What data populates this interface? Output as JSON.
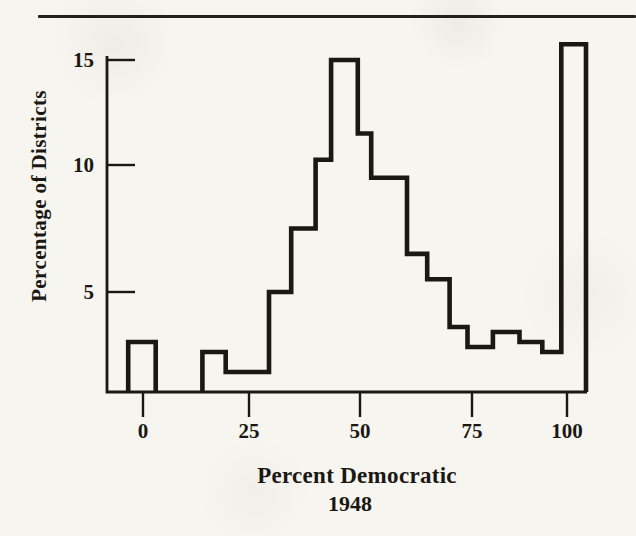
{
  "page": {
    "background_hex": "#f6f5f0",
    "ink_hex": "#1b1813",
    "top_rule_present": true
  },
  "chart_data": {
    "type": "bar",
    "subtype": "step-outline histogram (scanned book figure)",
    "title": "",
    "xlabel": "Percent Democratic",
    "xlabel_line2": "1948",
    "ylabel": "Percentage of Districts",
    "x_ticks": [
      0,
      25,
      50,
      75,
      100
    ],
    "y_ticks": [
      5,
      10,
      15
    ],
    "xlim": [
      -8.5,
      105
    ],
    "ylim": [
      0,
      16.5
    ],
    "grid": false,
    "legend": false,
    "bins": [
      {
        "x0": -3.5,
        "x1": 3,
        "height": 2.5
      },
      {
        "x0": 14,
        "x1": 19.5,
        "height": 2
      },
      {
        "x0": 19.5,
        "x1": 29.5,
        "height": 1
      },
      {
        "x0": 29.5,
        "x1": 34.5,
        "height": 5
      },
      {
        "x0": 34.5,
        "x1": 40,
        "height": 7.5
      },
      {
        "x0": 40,
        "x1": 43.5,
        "height": 10.25
      },
      {
        "x0": 43.5,
        "x1": 49.5,
        "height": 15
      },
      {
        "x0": 49.5,
        "x1": 52.5,
        "height": 11.5
      },
      {
        "x0": 52.5,
        "x1": 60.5,
        "height": 9.5
      },
      {
        "x0": 60.5,
        "x1": 65,
        "height": 6.5
      },
      {
        "x0": 65,
        "x1": 70,
        "height": 5.5
      },
      {
        "x0": 70,
        "x1": 74,
        "height": 3.25
      },
      {
        "x0": 74,
        "x1": 80.5,
        "height": 2.25
      },
      {
        "x0": 80.5,
        "x1": 87.5,
        "height": 3
      },
      {
        "x0": 87.5,
        "x1": 93.5,
        "height": 2.5
      },
      {
        "x0": 93.5,
        "x1": 98.5,
        "height": 2
      },
      {
        "x0": 98.5,
        "x1": 105,
        "height": 15.75
      }
    ]
  }
}
